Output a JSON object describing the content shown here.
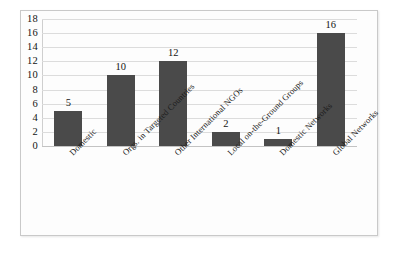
{
  "chart_data": {
    "type": "bar",
    "title": "",
    "subtitle": "",
    "xlabel": "",
    "ylabel": "",
    "ylim": [
      0,
      18
    ],
    "ytick_step": 2,
    "yticks": [
      "18",
      "16",
      "14",
      "12",
      "10",
      "8",
      "6",
      "4",
      "2",
      "0"
    ],
    "grid": true,
    "legend": false,
    "legend_position": "none",
    "bar_color": "#4a4a4a",
    "gridline_color": "#dcdcdc",
    "categories": [
      "Domestic",
      "Orgs. in Targeted Countries",
      "Other International NGOs",
      "Local on-the-Ground Groups",
      "Domestic Networks",
      "Global Networks"
    ],
    "values": [
      5,
      10,
      12,
      2,
      1,
      16
    ],
    "data_labels": [
      "5",
      "10",
      "12",
      "2",
      "1",
      "16"
    ],
    "series": [
      {
        "name": "",
        "values": [
          5,
          10,
          12,
          2,
          1,
          16
        ]
      }
    ]
  }
}
